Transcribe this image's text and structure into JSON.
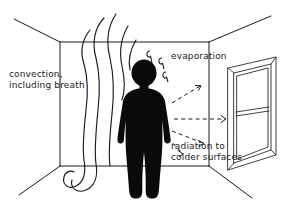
{
  "diagram": {
    "background_color": "#ffffff",
    "ink_color": "#1a1a1a",
    "figure_color": "#0a0a0a",
    "labels": {
      "convection": "convection,\nincluding breath",
      "evaporation": "evaporation",
      "radiation": "radiation to\ncolder surfaces"
    },
    "elements": {
      "room": "room-perspective-box",
      "window": "window-on-right-wall",
      "person": "black-human-silhouette",
      "convection_streams": 4,
      "evaporation_droplets": 3,
      "radiation_arrows": 4
    }
  }
}
